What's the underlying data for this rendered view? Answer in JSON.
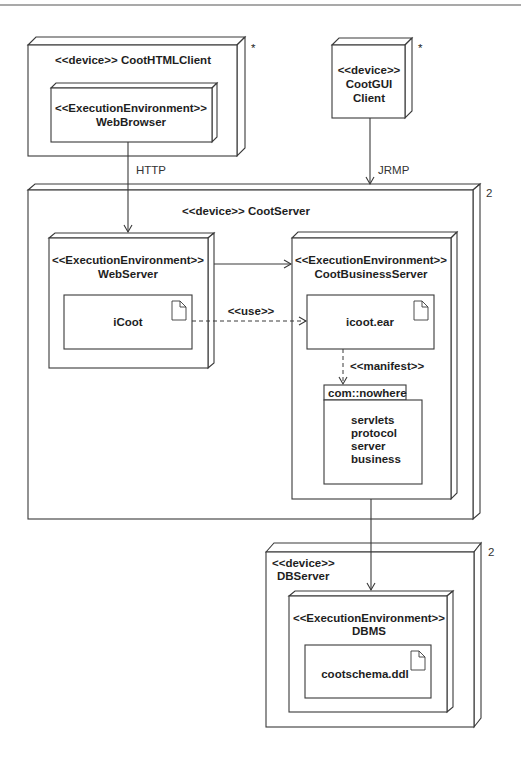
{
  "diagram": {
    "type": "UML deployment diagram",
    "nodes": {
      "html_client": {
        "stereotype": "<<device>>",
        "name": "CootHTMLClient",
        "title": "<<device>> CootHTMLClient",
        "multiplicity": "*",
        "execution_environment": {
          "stereotype": "<<ExecutionEnvironment>>",
          "name": "WebBrowser"
        }
      },
      "gui_client": {
        "stereotype": "<<device>>",
        "name_line1": "CootGUI",
        "name_line2": "Client",
        "multiplicity": "*"
      },
      "server": {
        "title": "<<device>> CootServer",
        "multiplicity": "2",
        "web_server": {
          "stereotype": "<<ExecutionEnvironment>>",
          "name": "WebServer",
          "artifact": "iCoot"
        },
        "business_server": {
          "stereotype": "<<ExecutionEnvironment>>",
          "name": "CootBusinessServer",
          "artifact": "icoot.ear",
          "package": {
            "name": "com::nowhere",
            "contents": [
              "servlets",
              "protocol",
              "server",
              "business"
            ]
          }
        }
      },
      "db_server": {
        "stereotype": "<<device>>",
        "name": "DBServer",
        "multiplicity": "2",
        "execution_environment": {
          "stereotype": "<<ExecutionEnvironment>>",
          "name": "DBMS",
          "artifact": "cootschema.ddl"
        }
      }
    },
    "connections": {
      "http": "HTTP",
      "jrmp": "JRMP",
      "use": "<<use>>",
      "manifest": "<<manifest>>"
    }
  }
}
